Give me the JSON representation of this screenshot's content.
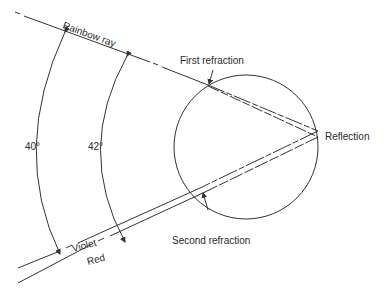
{
  "diagram": {
    "labels": {
      "rainbow_ray": "Rainbow ray",
      "first_refraction": "First refraction",
      "reflection": "Reflection",
      "second_refraction": "Second refraction",
      "violet": "Violet",
      "red": "Red",
      "angle_violet": "40°",
      "angle_red": "42°"
    },
    "colors": {
      "line": "#333333",
      "background": "#ffffff"
    }
  }
}
